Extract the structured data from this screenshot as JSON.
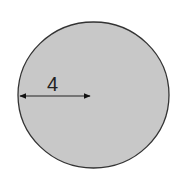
{
  "diagram": {
    "shape": "circle",
    "fill_color": "#c8c8c8",
    "stroke_color": "#333333",
    "radius_label": "4",
    "measurement": "radius"
  }
}
